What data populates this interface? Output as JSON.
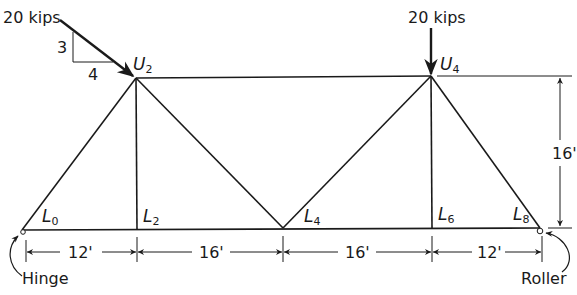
{
  "diagram": {
    "type": "truss",
    "stroke_color": "#1a1a1a",
    "background": "#ffffff",
    "loads": [
      {
        "id": "load-U2",
        "label": "20 kips",
        "at": "U2",
        "direction": "inclined",
        "slope": {
          "rise": "3",
          "run": "4"
        }
      },
      {
        "id": "load-U4",
        "label": "20 kips",
        "at": "U4",
        "direction": "downward"
      }
    ],
    "nodes": {
      "U2": {
        "letter": "U",
        "sub": "2"
      },
      "U4": {
        "letter": "U",
        "sub": "4"
      },
      "L0": {
        "letter": "L",
        "sub": "0"
      },
      "L2": {
        "letter": "L",
        "sub": "2"
      },
      "L4": {
        "letter": "L",
        "sub": "4"
      },
      "L6": {
        "letter": "L",
        "sub": "6"
      },
      "L8": {
        "letter": "L",
        "sub": "8"
      }
    },
    "members": [
      [
        "L0",
        "L2"
      ],
      [
        "L2",
        "L4"
      ],
      [
        "L4",
        "L6"
      ],
      [
        "L6",
        "L8"
      ],
      [
        "U2",
        "U4"
      ],
      [
        "L0",
        "U2"
      ],
      [
        "U2",
        "L2"
      ],
      [
        "U2",
        "L4"
      ],
      [
        "L4",
        "U4"
      ],
      [
        "U4",
        "L6"
      ],
      [
        "U4",
        "L8"
      ]
    ],
    "dimensions": {
      "horizontal": [
        "12'",
        "16'",
        "16'",
        "12'"
      ],
      "vertical": "16'"
    },
    "supports": {
      "left": {
        "label": "Hinge",
        "at": "L0"
      },
      "right": {
        "label": "Roller",
        "at": "L8"
      }
    }
  }
}
